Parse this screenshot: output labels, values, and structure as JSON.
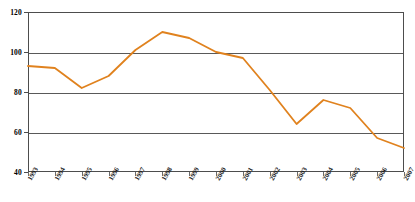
{
  "chart_data": {
    "type": "line",
    "title": "",
    "xlabel": "",
    "ylabel": "",
    "grid": true,
    "legend": "none",
    "ylim": [
      40,
      120
    ],
    "yticks": [
      40,
      60,
      80,
      100,
      120
    ],
    "ytick_labels": [
      "40",
      "60",
      "80",
      "100",
      "120"
    ],
    "categories": [
      "1993",
      "1994",
      "1995",
      "1996",
      "1997",
      "1998",
      "1999",
      "2000",
      "2001",
      "2002",
      "2003",
      "2004",
      "2005",
      "2006",
      "2007"
    ],
    "series": [
      {
        "name": "index",
        "color": "#E0821E",
        "values": [
          93,
          92,
          82,
          88,
          101,
          110,
          107,
          100,
          97,
          81,
          64,
          76,
          72,
          57,
          52
        ]
      }
    ]
  },
  "colors": {
    "line": "#E0821E",
    "grid": "#595959",
    "frame": "#4d4d4d",
    "background": "#ffffff"
  }
}
